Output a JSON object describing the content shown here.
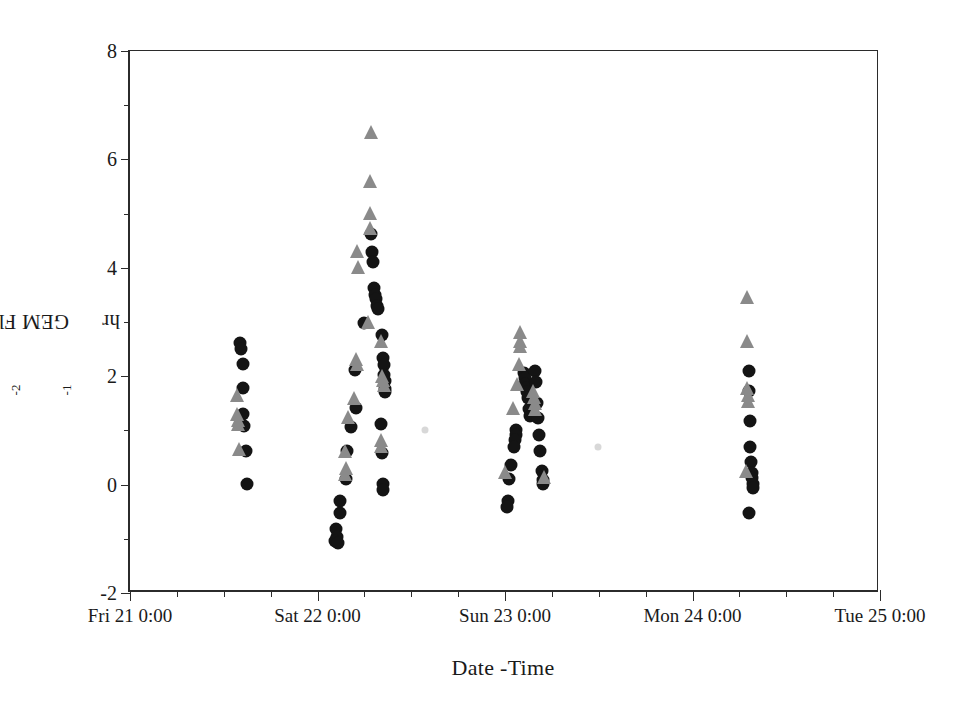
{
  "chart_data": {
    "type": "scatter",
    "title": "",
    "xlabel": "Date -Time",
    "ylabel": "GEM Flux (ng m-2 hr-1)",
    "ylabel_parts": {
      "prefix": "GEM Flux (ng m",
      "sup1": "-2",
      "mid": " hr",
      "sup2": "-1",
      "suffix": ")"
    },
    "ylim": [
      -2,
      8
    ],
    "yticks": [
      -2,
      0,
      2,
      4,
      6,
      8
    ],
    "ytick_labels": [
      "-2",
      "0",
      "2",
      "4",
      "6",
      "8"
    ],
    "yminor_step": 1,
    "xlim_days": [
      0,
      4
    ],
    "xticks": [
      0,
      1,
      2,
      3,
      4
    ],
    "xtick_labels": [
      "Fri 21 0:00",
      "Sat 22 0:00",
      "Sun 23 0:00",
      "Mon 24 0:00",
      "Tue 25 0:00"
    ],
    "xminor_step_hours": 6,
    "grid": false,
    "legend": "none",
    "series": [
      {
        "name": "GEM flux (circles)",
        "marker": "circle",
        "color": "#141414",
        "size": 13,
        "points": [
          [
            0.585,
            2.62
          ],
          [
            0.59,
            2.5
          ],
          [
            0.6,
            2.22
          ],
          [
            0.6,
            1.78
          ],
          [
            0.605,
            1.3
          ],
          [
            0.61,
            1.08
          ],
          [
            0.62,
            0.62
          ],
          [
            0.625,
            0.02
          ],
          [
            1.285,
            4.62
          ],
          [
            1.29,
            4.3
          ],
          [
            1.295,
            4.1
          ],
          [
            1.3,
            3.62
          ],
          [
            1.305,
            3.5
          ],
          [
            1.31,
            3.42
          ],
          [
            1.315,
            3.3
          ],
          [
            1.32,
            3.24
          ],
          [
            1.25,
            2.98
          ],
          [
            1.345,
            2.76
          ],
          [
            1.35,
            2.34
          ],
          [
            1.352,
            2.2
          ],
          [
            1.355,
            2.02
          ],
          [
            1.358,
            1.92
          ],
          [
            1.36,
            1.76
          ],
          [
            1.362,
            1.7
          ],
          [
            1.2,
            2.12
          ],
          [
            1.205,
            1.42
          ],
          [
            1.18,
            1.06
          ],
          [
            1.34,
            1.12
          ],
          [
            1.345,
            0.58
          ],
          [
            1.348,
            0.02
          ],
          [
            1.35,
            -0.1
          ],
          [
            1.155,
            0.62
          ],
          [
            1.15,
            0.1
          ],
          [
            1.12,
            -0.3
          ],
          [
            1.118,
            -0.52
          ],
          [
            1.1,
            -0.82
          ],
          [
            1.102,
            -0.96
          ],
          [
            1.095,
            -1.04
          ],
          [
            1.108,
            -1.08
          ],
          [
            2.1,
            2.06
          ],
          [
            2.105,
            1.96
          ],
          [
            2.108,
            1.86
          ],
          [
            2.11,
            1.78
          ],
          [
            2.115,
            1.7
          ],
          [
            2.12,
            1.6
          ],
          [
            2.128,
            1.4
          ],
          [
            2.132,
            1.26
          ],
          [
            2.06,
            1.0
          ],
          [
            2.058,
            0.92
          ],
          [
            2.055,
            0.82
          ],
          [
            2.05,
            0.7
          ],
          [
            2.03,
            0.36
          ],
          [
            2.02,
            0.1
          ],
          [
            2.015,
            -0.3
          ],
          [
            2.012,
            -0.42
          ],
          [
            2.16,
            2.1
          ],
          [
            2.165,
            1.9
          ],
          [
            2.17,
            1.5
          ],
          [
            2.175,
            1.22
          ],
          [
            2.18,
            0.92
          ],
          [
            2.188,
            0.62
          ],
          [
            2.195,
            0.26
          ],
          [
            2.2,
            0.08
          ],
          [
            2.205,
            0.02
          ],
          [
            3.3,
            2.1
          ],
          [
            3.302,
            1.72
          ],
          [
            3.305,
            1.18
          ],
          [
            3.308,
            0.7
          ],
          [
            3.31,
            0.42
          ],
          [
            3.315,
            0.22
          ],
          [
            3.318,
            0.12
          ],
          [
            3.32,
            0.02
          ],
          [
            3.322,
            -0.06
          ],
          [
            3.3,
            -0.52
          ]
        ]
      },
      {
        "name": "GEM flux (triangles)",
        "marker": "triangle",
        "color": "#8a8a8a",
        "size": 14,
        "points": [
          [
            0.57,
            1.52
          ],
          [
            0.572,
            1.18
          ],
          [
            0.575,
            1.06
          ],
          [
            0.578,
            0.98
          ],
          [
            0.58,
            0.52
          ],
          [
            1.285,
            6.38
          ],
          [
            1.282,
            5.48
          ],
          [
            1.28,
            4.88
          ],
          [
            1.278,
            4.6
          ],
          [
            1.21,
            4.18
          ],
          [
            1.215,
            3.88
          ],
          [
            1.27,
            2.88
          ],
          [
            1.205,
            2.18
          ],
          [
            1.208,
            2.1
          ],
          [
            1.195,
            1.46
          ],
          [
            1.16,
            1.12
          ],
          [
            1.34,
            2.52
          ],
          [
            1.345,
            1.88
          ],
          [
            1.348,
            1.8
          ],
          [
            1.352,
            1.7
          ],
          [
            1.338,
            0.7
          ],
          [
            1.34,
            0.58
          ],
          [
            1.148,
            0.5
          ],
          [
            1.15,
            0.18
          ],
          [
            1.145,
            0.06
          ],
          [
            2.08,
            2.68
          ],
          [
            2.082,
            2.52
          ],
          [
            2.078,
            2.42
          ],
          [
            2.072,
            2.1
          ],
          [
            2.065,
            1.72
          ],
          [
            2.04,
            1.28
          ],
          [
            2.0,
            0.1
          ],
          [
            2.15,
            1.6
          ],
          [
            2.155,
            1.48
          ],
          [
            2.158,
            1.38
          ],
          [
            2.162,
            1.26
          ],
          [
            2.21,
            0.02
          ],
          [
            3.29,
            3.34
          ],
          [
            3.288,
            2.52
          ],
          [
            3.292,
            1.66
          ],
          [
            3.294,
            1.52
          ],
          [
            3.296,
            1.42
          ],
          [
            3.286,
            0.12
          ]
        ]
      }
    ],
    "faint_marks": [
      [
        1.575,
        1.0
      ],
      [
        2.495,
        0.7
      ]
    ]
  },
  "axes": {
    "frame": {
      "left": 128,
      "top": 50,
      "width": 750,
      "height": 542
    },
    "colors": {
      "axis": "#2b2b2b",
      "circle": "#141414",
      "triangle": "#8a8a8a",
      "background": "#ffffff"
    }
  }
}
